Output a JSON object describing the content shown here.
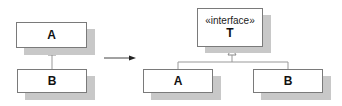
{
  "left_diagram": {
    "class_a": {
      "name": "A"
    },
    "class_b": {
      "name": "B"
    },
    "relation": "B inherits from A"
  },
  "transform_arrow": "right-arrow",
  "right_diagram": {
    "interface": {
      "stereotype": "«interface»",
      "name": "T"
    },
    "class_a": {
      "name": "A"
    },
    "class_b": {
      "name": "B"
    },
    "relation": "A and B realize T"
  },
  "colors": {
    "border": "#7a7a7a",
    "shadow": "#c8c8c8",
    "line": "#999999"
  }
}
